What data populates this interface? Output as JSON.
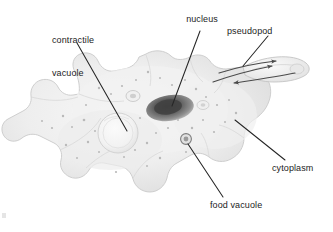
{
  "figure": {
    "background_color": "#ffffff",
    "text_color": "#1c1c1c",
    "leader_line_color": "#262626",
    "arrow_color": "#4a4a4a"
  },
  "labels": {
    "contractile_vacuole": {
      "line1": "contractile",
      "line2": "vacuole"
    },
    "nucleus": "nucleus",
    "pseudopod": "pseudopod",
    "cytoplasm": "cytoplasm",
    "food_vacuole": "food vacuole"
  },
  "structures": {
    "cell_body": "amoeba-cell-body",
    "nucleus": "nucleus-organelle",
    "contractile_vacuole": "contractile-vacuole-organelle",
    "food_vacuole": "food-vacuole-organelle",
    "small_vacuole": "small-vacuole-organelle",
    "pseudopod": "pseudopod-projection",
    "streaming_arrows": "cytoplasmic-streaming-arrows"
  }
}
